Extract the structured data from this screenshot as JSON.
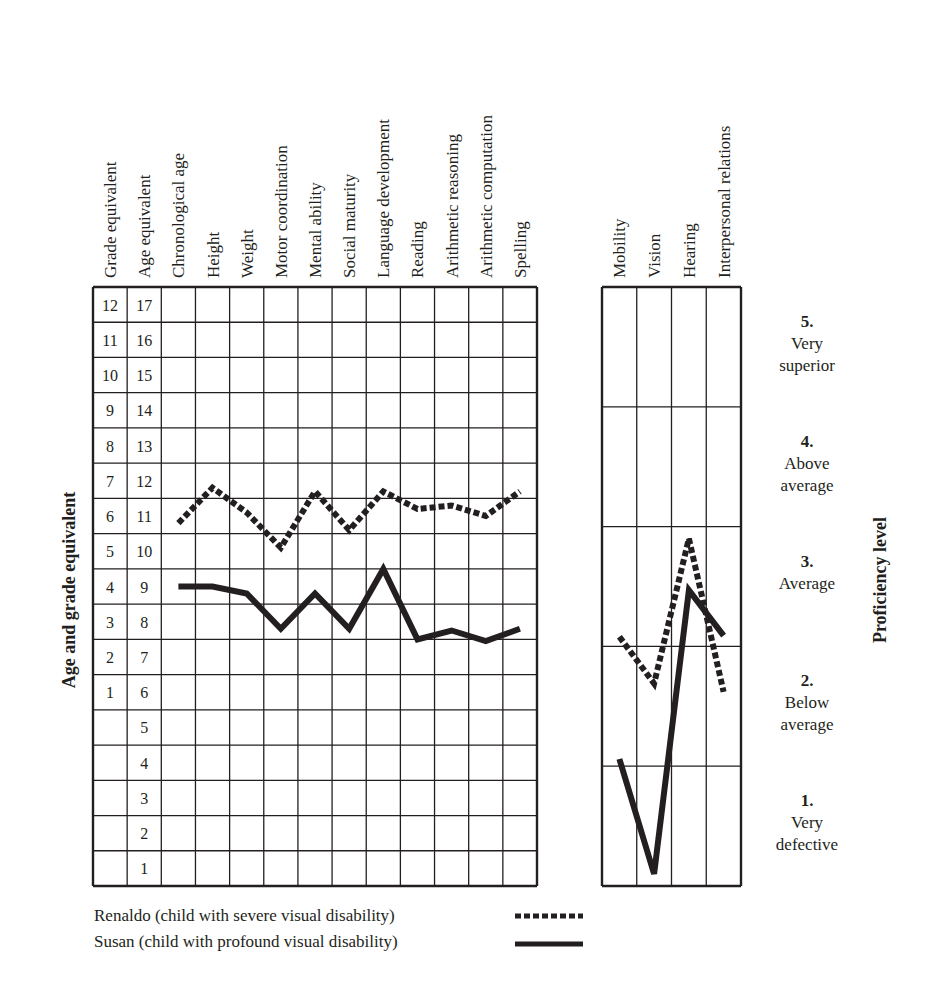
{
  "chart_data": [
    {
      "type": "line",
      "title": "",
      "ylabel": "Age and grade equivalent",
      "xlabel": "",
      "categories": [
        "Chronological age",
        "Height",
        "Weight",
        "Motor coordination",
        "Mental ability",
        "Social maturity",
        "Language development",
        "Reading",
        "Arithmetic reasoning",
        "Arithmetic computation",
        "Spelling"
      ],
      "row_label_columns": [
        "Grade equivalent",
        "Age equivalent"
      ],
      "age_equivalent_ticks": [
        17,
        16,
        15,
        14,
        13,
        12,
        11,
        10,
        9,
        8,
        7,
        6,
        5,
        4,
        3,
        2,
        1
      ],
      "grade_equivalent_ticks": [
        12,
        11,
        10,
        9,
        8,
        7,
        6,
        5,
        4,
        3,
        2,
        1,
        "",
        "",
        "",
        "",
        ""
      ],
      "ylim": [
        0.5,
        17.5
      ],
      "grid": true,
      "series": [
        {
          "name": "Renaldo",
          "style": "dashed",
          "values": [
            10.8,
            11.8,
            11.1,
            10.1,
            11.7,
            10.6,
            11.7,
            11.2,
            11.3,
            11.0,
            11.7
          ]
        },
        {
          "name": "Susan",
          "style": "solid",
          "values": [
            9.0,
            9.0,
            8.8,
            7.8,
            8.8,
            7.8,
            9.5,
            7.5,
            7.75,
            7.45,
            7.8
          ]
        }
      ]
    },
    {
      "type": "line",
      "title": "",
      "ylabel": "Proficiency level",
      "categories": [
        "Mobility",
        "Vision",
        "Hearing",
        "Interpersonal relations"
      ],
      "ylim": [
        0.5,
        5.5
      ],
      "grid": true,
      "levels": [
        {
          "num": "5.",
          "line1": "Very",
          "line2": "superior"
        },
        {
          "num": "4.",
          "line1": "Above",
          "line2": "average"
        },
        {
          "num": "3.",
          "line1": "Average",
          "line2": ""
        },
        {
          "num": "2.",
          "line1": "Below",
          "line2": "average"
        },
        {
          "num": "1.",
          "line1": "Very",
          "line2": "defective"
        }
      ],
      "series": [
        {
          "name": "Renaldo",
          "style": "dashed",
          "values": [
            2.58,
            2.19,
            3.4,
            2.12
          ]
        },
        {
          "name": "Susan",
          "style": "solid",
          "values": [
            1.56,
            0.6,
            2.97,
            2.59
          ]
        }
      ]
    }
  ],
  "legend": [
    {
      "label": "Renaldo  (child with severe visual disability)",
      "style": "dashed"
    },
    {
      "label": "Susan  (child with profound visual disability)",
      "style": "solid"
    }
  ],
  "colors": {
    "ink": "#231f20",
    "grid": "#231f20",
    "background": "#ffffff"
  }
}
